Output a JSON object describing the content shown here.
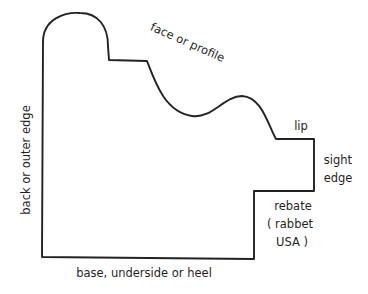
{
  "diagram": {
    "colors": {
      "background": "#ffffff",
      "stroke": "#222222",
      "text": "#1f1f1f"
    },
    "labels": {
      "face": "face or profile",
      "lip": "lip",
      "sight_edge_line1": "sight",
      "sight_edge_line2": "edge",
      "rebate_line1": "rebate",
      "rebate_line2": "( rabbet",
      "rebate_line3": "USA )",
      "base": "base, underside or heel",
      "back": "back or outer edge"
    },
    "parts": [
      "back or outer edge",
      "face or profile",
      "lip",
      "sight edge",
      "rebate (rabbet USA)",
      "base, underside or heel"
    ]
  }
}
